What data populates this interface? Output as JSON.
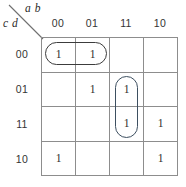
{
  "diagram": {
    "type": "karnaugh-map",
    "column_variables_label": "a b",
    "row_variables_label": "c d",
    "column_headers": [
      "00",
      "01",
      "11",
      "10"
    ],
    "row_headers": [
      "00",
      "01",
      "11",
      "10"
    ],
    "cells": [
      [
        "1",
        "1",
        "",
        ""
      ],
      [
        "",
        "1",
        "1",
        ""
      ],
      [
        "",
        "",
        "1",
        "1"
      ],
      [
        "1",
        "",
        "",
        "1"
      ]
    ],
    "groups": [
      {
        "name": "horizontal-pair-row00",
        "orientation": "horizontal",
        "cells": [
          "row00-col00",
          "row00-col01"
        ],
        "color": "#3c3c3c"
      },
      {
        "name": "vertical-pair-col11",
        "orientation": "vertical",
        "cells": [
          "row01-col11",
          "row11-col11"
        ],
        "color": "#3d4f60"
      }
    ],
    "colors": {
      "grid_line": "#8d8d8d",
      "text": "#2d2d2d",
      "background": "#ffffff",
      "group_dark": "#3c3c3c",
      "group_blue": "#3d4f60"
    }
  }
}
